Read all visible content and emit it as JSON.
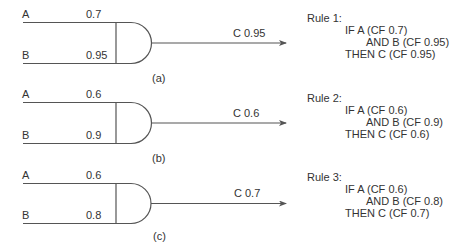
{
  "diagrams": [
    {
      "id": "a",
      "caption": "(a)",
      "input_a": {
        "label": "A",
        "cf": "0.7"
      },
      "input_b": {
        "label": "B",
        "cf": "0.95"
      },
      "output": {
        "label": "C 0.95"
      },
      "rule": {
        "title": "Rule 1:",
        "if_line": "IF A (CF 0.7)",
        "and_line": "AND B (CF 0.95)",
        "then_line": "THEN C (CF 0.95)"
      }
    },
    {
      "id": "b",
      "caption": "(b)",
      "input_a": {
        "label": "A",
        "cf": "0.6"
      },
      "input_b": {
        "label": "B",
        "cf": "0.9"
      },
      "output": {
        "label": "C 0.6"
      },
      "rule": {
        "title": "Rule 2:",
        "if_line": "IF A (CF 0.6)",
        "and_line": "AND B (CF 0.9)",
        "then_line": "THEN C (CF 0.6)"
      }
    },
    {
      "id": "c",
      "caption": "(c)",
      "input_a": {
        "label": "A",
        "cf": "0.6"
      },
      "input_b": {
        "label": "B",
        "cf": "0.8"
      },
      "output": {
        "label": "C 0.7"
      },
      "rule": {
        "title": "Rule 3:",
        "if_line": "IF A (CF 0.6)",
        "and_line": "AND B (CF 0.8)",
        "then_line": "THEN C (CF 0.7)"
      }
    }
  ],
  "colors": {
    "stroke": "#555555",
    "text": "#333333",
    "background": "#ffffff"
  }
}
